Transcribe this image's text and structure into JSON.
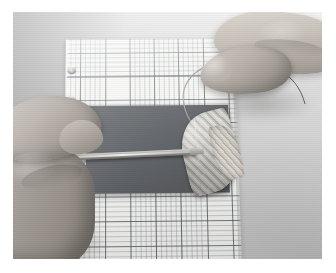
{
  "image": {
    "kind": "photograph",
    "subject": "Two hands assembling a striped leaf-shaped specimen with a thin wire on graph paper",
    "orientation": "landscape",
    "border_color": "#ffffff",
    "width_px": 336,
    "height_px": 273
  },
  "scene": {
    "background": {
      "name": "table-surface",
      "description": "Plain light gray backdrop surface",
      "color": "#cfcfcf"
    },
    "graph_paper": {
      "name": "graph-paper-sheet",
      "description": "White square-ruled graph paper sheet with punched binder holes along left edge",
      "paper_color": "#f4f4f2",
      "minor_grid_color": "#787d82",
      "major_grid_color": "#3c4248",
      "minor_cell_px": 5,
      "major_cell_px": 25,
      "hole_count": 4
    },
    "mat": {
      "name": "dark-rubber-mat",
      "description": "Dark gray rectangular cutting mat lying on the graph paper",
      "color": "#62656a"
    },
    "leaf": {
      "name": "striped-leaf-specimen",
      "description": "Pointed oval leaf-shaped piece with diagonal light and dark striping",
      "light_stripe_color": "#e8e6e0",
      "dark_stripe_color": "#aeaaa2",
      "rotation_deg": -14
    },
    "wire": {
      "name": "thin-wire-loop",
      "description": "Thin wire arcing from the leaf up over the paper toward the right hand",
      "color": "#8f8f8f"
    },
    "tool": {
      "name": "flat-spatula-tool",
      "description": "Thin flat metal spatula blade held by the left hand, tip resting near the leaf",
      "blade_color": "#a9a7a2"
    },
    "hands": [
      {
        "name": "left-hand",
        "description": "Left hand entering from lower left, fingers gripping the spatula tool",
        "position": "lower-left"
      },
      {
        "name": "right-hand",
        "description": "Right hand entering from upper right, thumb and index finger pinching the wire",
        "position": "upper-right"
      }
    ]
  }
}
